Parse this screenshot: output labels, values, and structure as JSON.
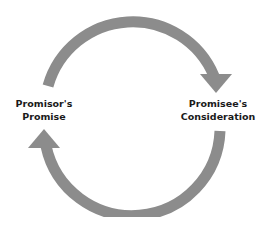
{
  "diagram": {
    "type": "cycle",
    "left_node": {
      "line1": "Promisor's",
      "line2": "Promise"
    },
    "right_node": {
      "line1": "Promisee's",
      "line2": "Consideration"
    },
    "arrows": [
      {
        "from": "Promisor's Promise",
        "to": "Promisee's Consideration",
        "path": "top arc, clockwise"
      },
      {
        "from": "Promisee's Consideration",
        "to": "Promisor's Promise",
        "path": "bottom arc, clockwise"
      }
    ],
    "colors": {
      "arrow": "#8c8c8c",
      "text": "#1a1a1a",
      "background": "#ffffff"
    }
  }
}
